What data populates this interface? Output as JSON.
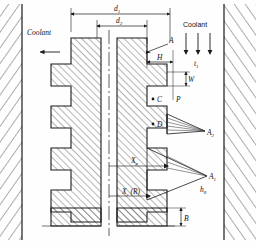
{
  "diagram": {
    "line_color": "#1a1a1a",
    "hatch_color": "#444444",
    "labels": {
      "coolant_left": "Coolant",
      "coolant_right": "Coolant",
      "t1": "t",
      "t1_sub": "1",
      "d1": "d",
      "d1_sub": "1",
      "d2": "d",
      "d2_sub": "2",
      "A": "A",
      "H": "H",
      "W": "W",
      "C": "C",
      "P": "P",
      "D": "D",
      "A2": "A",
      "A2_sub": "2",
      "A1": "A",
      "A1_sub": "1",
      "h0": "h",
      "h0_sub": "0",
      "Xp": "X",
      "Xp_sub": "p",
      "Xs": "X",
      "Xs_sub": "s",
      "Xs_paren": "(R)",
      "B": "B"
    }
  }
}
